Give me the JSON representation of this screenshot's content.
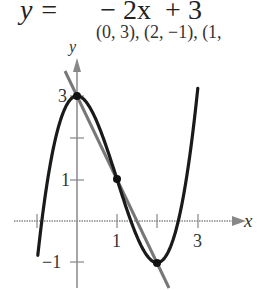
{
  "header": {
    "equation_lhs": "y =",
    "equation_rhs": "− 2x  + 3",
    "points_text": "(0, 3), (2, −1), (1,"
  },
  "chart_data": {
    "type": "line",
    "title": "",
    "xlabel": "x",
    "ylabel": "y",
    "xlim": [
      -1.2,
      4.0
    ],
    "ylim": [
      -1.5,
      3.6
    ],
    "x_ticks": [
      -1,
      1,
      2,
      3
    ],
    "x_tick_labels": [
      "",
      "1",
      "",
      "3"
    ],
    "y_ticks": [
      3,
      2,
      1,
      -1
    ],
    "y_tick_labels": [
      "3",
      "",
      "1",
      "−1"
    ],
    "grid": false,
    "series": [
      {
        "name": "cubic",
        "expression": "y = x^3 - 3x^2 + 3",
        "color": "#1a1a1a",
        "x": [
          -0.95,
          -0.5,
          0,
          0.5,
          1,
          1.5,
          2,
          2.5,
          3.0
        ],
        "y": [
          -0.57,
          2.13,
          3,
          2.38,
          1,
          -0.38,
          -1,
          -0.13,
          3.0
        ]
      },
      {
        "name": "line",
        "expression": "y = -2x + 3",
        "color": "#777777",
        "x": [
          -0.3,
          2.3
        ],
        "y": [
          3.6,
          -1.6
        ]
      }
    ],
    "points": [
      {
        "x": 0,
        "y": 3
      },
      {
        "x": 1,
        "y": 1
      },
      {
        "x": 2,
        "y": -1
      }
    ]
  }
}
